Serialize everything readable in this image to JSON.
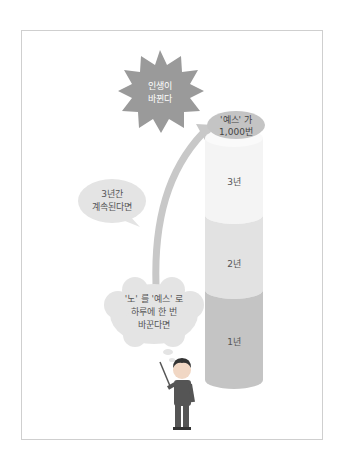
{
  "diagram": {
    "starburst": {
      "line1": "인생이",
      "line2": "바뀐다",
      "color": "#9a9a9a"
    },
    "cylinder": {
      "top_label": {
        "line1": "'예스' 가",
        "line2": "1,000번"
      },
      "segments": [
        {
          "label": "3년",
          "color": "#f4f4f4"
        },
        {
          "label": "2년",
          "color": "#e2e2e2"
        },
        {
          "label": "1년",
          "color": "#c4c4c4"
        }
      ]
    },
    "bubble_middle": {
      "line1": "3년간",
      "line2": "계속된다면"
    },
    "bubble_bottom": {
      "line1": "'노' 를 '예스' 로",
      "line2": "하루에 한 번",
      "line3": "바꾼다면"
    },
    "arrow": {
      "color": "#c8c8c8"
    },
    "character": {
      "description": "man-with-pointer"
    }
  }
}
